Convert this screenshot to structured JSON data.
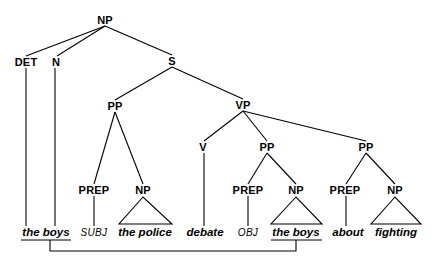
{
  "figure": {
    "kind": "syntax-tree-diagram",
    "width": 443,
    "height": 271,
    "background_color": "#ffffff",
    "line_color": "#000000",
    "sentence_surface": "the boys debate about fighting",
    "sentence_underlying": "the boys SUBJ the police debate OBJ the boys about fighting"
  },
  "nodes": {
    "np_root": {
      "label": "NP",
      "x": 105,
      "y": 20
    },
    "det": {
      "label": "DET",
      "x": 26,
      "y": 62
    },
    "n": {
      "label": "N",
      "x": 56,
      "y": 62
    },
    "s": {
      "label": "S",
      "x": 172,
      "y": 61
    },
    "pp1": {
      "label": "PP",
      "x": 115,
      "y": 106
    },
    "vp": {
      "label": "VP",
      "x": 243,
      "y": 105
    },
    "prep1": {
      "label": "PREP",
      "x": 94,
      "y": 190
    },
    "np1": {
      "label": "NP",
      "x": 143,
      "y": 190
    },
    "v": {
      "label": "V",
      "x": 203,
      "y": 147
    },
    "pp2": {
      "label": "PP",
      "x": 267,
      "y": 147
    },
    "pp3": {
      "label": "PP",
      "x": 366,
      "y": 147
    },
    "prep2": {
      "label": "PREP",
      "x": 248,
      "y": 190
    },
    "np2": {
      "label": "NP",
      "x": 296,
      "y": 190
    },
    "prep3": {
      "label": "PREP",
      "x": 345,
      "y": 190
    },
    "np3": {
      "label": "NP",
      "x": 395,
      "y": 190
    }
  },
  "leaves": [
    {
      "id": "leaf-the-boys-left",
      "text": "the boys",
      "x": 46,
      "y": 232,
      "style": "bold-italic",
      "underlined": true
    },
    {
      "id": "leaf-subj",
      "text": "SUBJ",
      "x": 94,
      "y": 232,
      "style": "italic",
      "underlined": false
    },
    {
      "id": "leaf-the-police",
      "text": "the police",
      "x": 145,
      "y": 232,
      "style": "bold-italic",
      "underlined": false
    },
    {
      "id": "leaf-debate",
      "text": "debate",
      "x": 205,
      "y": 232,
      "style": "bold-italic",
      "underlined": false
    },
    {
      "id": "leaf-obj",
      "text": "OBJ",
      "x": 248,
      "y": 232,
      "style": "italic",
      "underlined": false
    },
    {
      "id": "leaf-the-boys-right",
      "text": "the boys",
      "x": 296,
      "y": 232,
      "style": "bold-italic",
      "underlined": true
    },
    {
      "id": "leaf-about",
      "text": "about",
      "x": 348,
      "y": 232,
      "style": "bold-italic",
      "underlined": false
    },
    {
      "id": "leaf-fighting",
      "text": "fighting",
      "x": 396,
      "y": 232,
      "style": "bold-italic",
      "underlined": false
    }
  ],
  "edges": [
    {
      "from": "np_root",
      "to": "det",
      "x1": 105,
      "y1": 26,
      "x2": 26,
      "y2": 56
    },
    {
      "from": "np_root",
      "to": "n",
      "x1": 105,
      "y1": 26,
      "x2": 57,
      "y2": 56
    },
    {
      "from": "np_root",
      "to": "s",
      "x1": 105,
      "y1": 26,
      "x2": 172,
      "y2": 55
    },
    {
      "from": "s",
      "to": "pp1",
      "x1": 172,
      "y1": 67,
      "x2": 115,
      "y2": 100
    },
    {
      "from": "s",
      "to": "vp",
      "x1": 172,
      "y1": 67,
      "x2": 243,
      "y2": 99
    },
    {
      "from": "pp1",
      "to": "prep1",
      "x1": 115,
      "y1": 112,
      "x2": 94,
      "y2": 184
    },
    {
      "from": "pp1",
      "to": "np1",
      "x1": 115,
      "y1": 112,
      "x2": 143,
      "y2": 184
    },
    {
      "from": "vp",
      "to": "v",
      "x1": 243,
      "y1": 111,
      "x2": 203,
      "y2": 141
    },
    {
      "from": "vp",
      "to": "pp2",
      "x1": 243,
      "y1": 111,
      "x2": 267,
      "y2": 141
    },
    {
      "from": "vp",
      "to": "pp3",
      "x1": 243,
      "y1": 111,
      "x2": 366,
      "y2": 141
    },
    {
      "from": "pp2",
      "to": "prep2",
      "x1": 267,
      "y1": 153,
      "x2": 248,
      "y2": 184
    },
    {
      "from": "pp2",
      "to": "np2",
      "x1": 267,
      "y1": 153,
      "x2": 296,
      "y2": 184
    },
    {
      "from": "pp3",
      "to": "prep3",
      "x1": 366,
      "y1": 153,
      "x2": 345,
      "y2": 184
    },
    {
      "from": "pp3",
      "to": "np3",
      "x1": 366,
      "y1": 153,
      "x2": 395,
      "y2": 184
    },
    {
      "from": "det",
      "to": "leaf-the-boys-left",
      "x1": 26,
      "y1": 68,
      "x2": 26,
      "y2": 226
    },
    {
      "from": "n",
      "to": "leaf-the-boys-left",
      "x1": 55,
      "y1": 68,
      "x2": 55,
      "y2": 226
    },
    {
      "from": "prep1",
      "to": "leaf-subj",
      "x1": 94,
      "y1": 196,
      "x2": 94,
      "y2": 226
    },
    {
      "from": "v",
      "to": "leaf-debate",
      "x1": 204,
      "y1": 153,
      "x2": 204,
      "y2": 226
    },
    {
      "from": "prep2",
      "to": "leaf-obj",
      "x1": 248,
      "y1": 196,
      "x2": 248,
      "y2": 226
    },
    {
      "from": "prep3",
      "to": "leaf-about",
      "x1": 346,
      "y1": 196,
      "x2": 346,
      "y2": 226
    }
  ],
  "triangles": [
    {
      "id": "triangle-the-police",
      "apex_x": 143,
      "apex_y": 197,
      "left_x": 119,
      "right_x": 172,
      "base_y": 224
    },
    {
      "id": "triangle-the-boys-right",
      "apex_x": 296,
      "apex_y": 197,
      "left_x": 271,
      "right_x": 322,
      "base_y": 224
    },
    {
      "id": "triangle-fighting",
      "apex_x": 395,
      "apex_y": 197,
      "left_x": 371,
      "right_x": 421,
      "base_y": 224
    }
  ],
  "underlines": [
    {
      "id": "underline-the-boys-left",
      "x1": 21,
      "x2": 71,
      "y": 240
    },
    {
      "id": "underline-the-boys-right",
      "x1": 271,
      "x2": 322,
      "y": 240
    }
  ],
  "coindex_link": {
    "id": "movement-link",
    "description": "line connecting the two the boys constituents",
    "left_x": 50,
    "right_x": 296,
    "top_y": 240,
    "bottom_y": 251
  }
}
